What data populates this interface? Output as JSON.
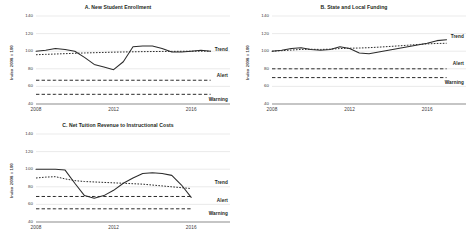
{
  "figure": {
    "background": "#ffffff",
    "line_color": "#2b2b2b",
    "grid_color": "#c9c9c9"
  },
  "chart_data": [
    {
      "type": "line",
      "panel": "A",
      "title": "A. New Student Enrollment",
      "xlabel": "",
      "ylabel": "Index 2008 = 100",
      "ylim": [
        40,
        140
      ],
      "yticks": [
        40,
        60,
        80,
        100,
        120,
        140
      ],
      "xlim": [
        2008,
        2018
      ],
      "xticks": [
        2008,
        2012,
        2016
      ],
      "xtick_labels": [
        "2008",
        "2012",
        "2016"
      ],
      "grid": true,
      "legend": "inline-right",
      "x": [
        2008,
        2008.5,
        2009,
        2009.5,
        2010,
        2010.5,
        2011,
        2011.5,
        2012,
        2012.5,
        2013,
        2013.5,
        2014,
        2014.5,
        2015,
        2015.5,
        2016,
        2016.5,
        2017
      ],
      "series": [
        {
          "name": "Actual",
          "style": "solid",
          "values": [
            100,
            101,
            103,
            102,
            100,
            93,
            85,
            82,
            79,
            88,
            105,
            106,
            106,
            103,
            99,
            99,
            100,
            101,
            100
          ]
        },
        {
          "name": "Trend",
          "style": "dotted",
          "values": [
            96,
            96.4,
            96.8,
            97.2,
            97.6,
            98,
            98.3,
            98.6,
            98.9,
            99.1,
            99.3,
            99.5,
            99.6,
            99.7,
            99.8,
            99.9,
            100,
            100,
            100
          ]
        },
        {
          "name": "Alert",
          "style": "dashed",
          "values": [
            67,
            67,
            67,
            67,
            67,
            67,
            67,
            67,
            67,
            67,
            67,
            67,
            67,
            67,
            67,
            67,
            67,
            67,
            67
          ]
        },
        {
          "name": "Warning",
          "style": "dashed",
          "values": [
            51,
            51,
            51,
            51,
            51,
            51,
            51,
            51,
            51,
            51,
            51,
            51,
            51,
            51,
            51,
            51,
            51,
            51,
            51
          ]
        }
      ],
      "annotations": [
        {
          "text": "Trend",
          "value": 101
        },
        {
          "text": "Alert",
          "value": 72
        },
        {
          "text": "Warning",
          "value": 45
        }
      ]
    },
    {
      "type": "line",
      "panel": "B",
      "title": "B. State and Local Funding",
      "xlabel": "",
      "ylabel": "Index 2008 = 100",
      "ylim": [
        40,
        140
      ],
      "yticks": [
        40,
        60,
        80,
        100,
        120,
        140
      ],
      "xlim": [
        2008,
        2018
      ],
      "xticks": [
        2008,
        2012,
        2016
      ],
      "xtick_labels": [
        "2008",
        "2012",
        "2016"
      ],
      "grid": true,
      "legend": "inline-right",
      "x": [
        2008,
        2008.5,
        2009,
        2009.5,
        2010,
        2010.5,
        2011,
        2011.5,
        2012,
        2012.5,
        2013,
        2013.5,
        2014,
        2014.5,
        2015,
        2015.5,
        2016,
        2016.5,
        2017
      ],
      "series": [
        {
          "name": "Actual",
          "style": "solid",
          "values": [
            100,
            101,
            103,
            104,
            102,
            101,
            102,
            105,
            103,
            98,
            97,
            99,
            101,
            103,
            105,
            107,
            109,
            112,
            113
          ]
        },
        {
          "name": "Trend",
          "style": "dotted",
          "values": [
            100,
            100.6,
            101.3,
            102,
            102.2,
            102,
            102.3,
            103,
            103.4,
            103.6,
            104,
            104.6,
            105.3,
            106,
            106.8,
            107.6,
            108.3,
            108.8,
            109
          ]
        },
        {
          "name": "Alert",
          "style": "dashed",
          "values": [
            80,
            80,
            80,
            80,
            80,
            80,
            80,
            80,
            80,
            80,
            80,
            80,
            80,
            80,
            80,
            80,
            80,
            80,
            80
          ]
        },
        {
          "name": "Warning",
          "style": "dashed",
          "values": [
            70,
            70,
            70,
            70,
            70,
            70,
            70,
            70,
            70,
            70,
            70,
            70,
            70,
            70,
            70,
            70,
            70,
            70,
            70
          ]
        }
      ],
      "annotations": [
        {
          "text": "Trend",
          "value": 116
        },
        {
          "text": "Alert",
          "value": 85
        },
        {
          "text": "Warning",
          "value": 64
        }
      ]
    },
    {
      "type": "line",
      "panel": "C",
      "title": "C. Net Tuition Revenue to Instructional Costs",
      "xlabel": "",
      "ylabel": "Index 2008 = 100",
      "ylim": [
        40,
        140
      ],
      "yticks": [
        40,
        60,
        80,
        100,
        120,
        140
      ],
      "xlim": [
        2008,
        2018
      ],
      "xticks": [
        2008,
        2012,
        2016
      ],
      "xtick_labels": [
        "2008",
        "2012",
        "2016"
      ],
      "grid": true,
      "legend": "inline-right",
      "x": [
        2008,
        2008.5,
        2009,
        2009.5,
        2010,
        2010.5,
        2011,
        2011.5,
        2012,
        2012.5,
        2013,
        2013.5,
        2014,
        2014.5,
        2015,
        2015.5,
        2016
      ],
      "series": [
        {
          "name": "Actual",
          "style": "solid",
          "values": [
            100,
            100,
            100,
            99,
            84,
            70,
            67,
            70,
            76,
            84,
            90,
            95,
            96,
            95,
            93,
            82,
            68
          ]
        },
        {
          "name": "Trend",
          "style": "dotted",
          "values": [
            90,
            91,
            91.5,
            89,
            87,
            86,
            85.5,
            85,
            84.5,
            84,
            83.5,
            83,
            82,
            81,
            80,
            79,
            78
          ]
        },
        {
          "name": "Alert",
          "style": "dashed",
          "values": [
            69,
            69,
            69,
            69,
            69,
            69,
            69,
            69,
            69,
            69,
            69,
            69,
            69,
            69,
            69,
            69,
            69
          ]
        },
        {
          "name": "Warning",
          "style": "dashed",
          "values": [
            55,
            55,
            55,
            55,
            55,
            55,
            55,
            55,
            55,
            55,
            55,
            55,
            55,
            55,
            55,
            55,
            55
          ]
        }
      ],
      "annotations": [
        {
          "text": "Trend",
          "value": 84
        },
        {
          "text": "Alert",
          "value": 64
        },
        {
          "text": "Warning",
          "value": 49
        }
      ]
    }
  ]
}
